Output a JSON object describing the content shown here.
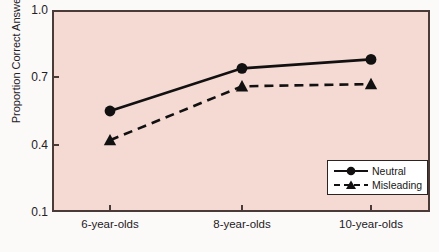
{
  "chart_data": {
    "type": "line",
    "title": "",
    "xlabel": "",
    "ylabel": "Proportion Correct Answers",
    "categories": [
      "6-year-olds",
      "8-year-olds",
      "10-year-olds"
    ],
    "ylim": [
      0.1,
      1.0
    ],
    "yticks": [
      "0.1",
      "0.4",
      "0.7",
      "1.0"
    ],
    "ytick_values": [
      0.1,
      0.4,
      0.7,
      1.0
    ],
    "grid": false,
    "legend_position": "bottom-right",
    "series": [
      {
        "name": "Neutral",
        "values": [
          0.55,
          0.74,
          0.78
        ],
        "line_style": "solid",
        "marker": "circle",
        "color": "#121011"
      },
      {
        "name": "Misleading",
        "values": [
          0.42,
          0.66,
          0.67
        ],
        "line_style": "dashed",
        "marker": "triangle",
        "color": "#121011"
      }
    ]
  },
  "axes": {
    "plot_background": "#f4dad2",
    "frame_color": "#4a3b38",
    "tick_labels_y": [
      "1.0",
      "0.7",
      "0.4",
      "0.1"
    ],
    "tick_labels_x": [
      "6-year-olds",
      "8-year-olds",
      "10-year-olds"
    ],
    "y_axis_title": "Proportion Correct Answers"
  },
  "legend": {
    "entries": [
      {
        "label": "Neutral",
        "style": "solid-circle"
      },
      {
        "label": "Misleading",
        "style": "dashed-triangle"
      }
    ]
  }
}
